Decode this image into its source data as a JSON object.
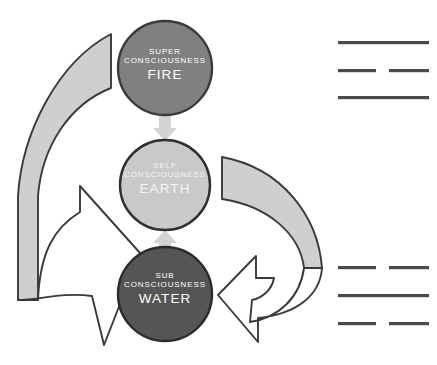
{
  "diagram": {
    "nodes": [
      {
        "id": "super-consciousness",
        "tier": "SUPER CONSCIOUSNESS",
        "element": "FIRE",
        "fill": "#808080",
        "stroke": "#3a3a3a",
        "text_color": "#ffffff",
        "cx": 165,
        "cy": 68,
        "r": 47
      },
      {
        "id": "self-consciousness",
        "tier": "SELF CONSCIOUSNESS",
        "element": "EARTH",
        "fill": "#c9c9c9",
        "stroke": "#2f2f2f",
        "text_color": "#f4f4f4",
        "cx": 165,
        "cy": 185,
        "r": 45
      },
      {
        "id": "sub-consciousness",
        "tier": "SUB CONSCIOUSNESS",
        "element": "WATER",
        "fill": "#555555",
        "stroke": "#2b2b2b",
        "text_color": "#ffffff",
        "cx": 165,
        "cy": 294,
        "r": 47
      }
    ],
    "connectors": [
      {
        "id": "fire-to-earth",
        "direction": "down",
        "from": "super-consciousness",
        "to": "self-consciousness",
        "fill": "#d4d4d4"
      },
      {
        "id": "water-to-earth",
        "direction": "up",
        "from": "sub-consciousness",
        "to": "self-consciousness",
        "fill": "#d4d4d4"
      }
    ],
    "arrows": [
      {
        "id": "left-sweep-arrow",
        "side": "left",
        "from": "super-consciousness",
        "to": "sub-consciousness",
        "band_fill": "#cfcfcf",
        "head_fill": "#ffffff",
        "stroke": "#3a3a3a"
      },
      {
        "id": "right-sweep-arrow",
        "side": "right",
        "from": "self-consciousness",
        "to": "sub-consciousness",
        "band_fill": "#cfcfcf",
        "head_fill": "#ffffff",
        "stroke": "#3a3a3a"
      }
    ],
    "redacted_text_blocks": [
      {
        "id": "upper-redacted-block",
        "lines": [
          {
            "segments": [
              {
                "x": 338,
                "width": 91
              }
            ]
          },
          {
            "segments": [
              {
                "x": 338,
                "width": 38
              },
              {
                "x": 389,
                "width": 40
              }
            ]
          },
          {
            "segments": [
              {
                "x": 338,
                "width": 91
              }
            ]
          }
        ],
        "color": "#4a4a4a"
      },
      {
        "id": "lower-redacted-block",
        "lines": [
          {
            "segments": [
              {
                "x": 338,
                "width": 38
              },
              {
                "x": 389,
                "width": 40
              }
            ]
          },
          {
            "segments": [
              {
                "x": 338,
                "width": 91
              }
            ]
          },
          {
            "segments": [
              {
                "x": 338,
                "width": 38
              },
              {
                "x": 389,
                "width": 40
              }
            ]
          }
        ],
        "color": "#4a4a4a"
      }
    ]
  }
}
